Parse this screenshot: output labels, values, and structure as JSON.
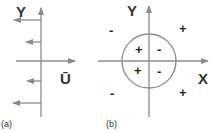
{
  "panel_a": {
    "label": "(a)",
    "y_axis_label": "Y",
    "x_axis_label": "Ū",
    "description": "Velocity profile with leftward arrows above and below horizontal axis"
  },
  "panel_b": {
    "label": "(b)",
    "y_axis_label": "Y",
    "x_axis_label": "X",
    "inner_signs": {
      "top_left": "+",
      "top_right": "-",
      "bottom_left": "+",
      "bottom_right": "-"
    },
    "outer_signs": {
      "top_left": "-",
      "top_right": "+",
      "bottom_left": "-",
      "bottom_right": "+"
    }
  },
  "colors": {
    "line": "#8a8a8a",
    "text": "#333333"
  }
}
